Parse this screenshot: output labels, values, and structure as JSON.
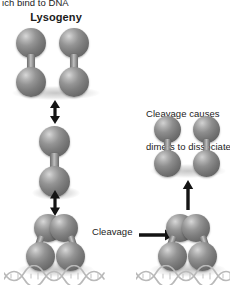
{
  "figure": {
    "title_fragment": "ich bind to DNA",
    "background_color": "#ffffff",
    "molecule_color": "#808080",
    "ink_color": "#1b1b1b"
  },
  "labels": {
    "caption_top": "ich bind to DNA",
    "lysogeny": "Lysogeny",
    "cleavage_causes_line1": "Cleavage causes",
    "cleavage_causes_line2": "dimers to dissociate",
    "cleavage": "Cleavage"
  },
  "panels": {
    "left": {
      "name": "lysogeny-pathway",
      "heading": "Lysogeny",
      "states": [
        {
          "id": "tetramer-pair",
          "description": "two free dimers side by side",
          "dimers": 2,
          "monomers_per_dimer": 2
        },
        {
          "id": "free-dimer",
          "description": "single free dimer",
          "dimers": 1,
          "monomers_per_dimer": 2
        },
        {
          "id": "dna-bound-dimer",
          "description": "dimer bound to DNA operator",
          "dimers": 1,
          "dna_bound": true
        }
      ],
      "equilibrium_arrows": 2
    },
    "right": {
      "name": "cleavage-pathway",
      "heading_line1": "Cleavage causes",
      "heading_line2": "dimers to dissociate",
      "states": [
        {
          "id": "dissociated-monomers",
          "description": "four dissociated monomers",
          "monomers": 4
        },
        {
          "id": "dna-bound-dimer-cleaved",
          "description": "DNA-bound dimer being cleaved",
          "dimers": 1,
          "dna_bound": true
        }
      ],
      "transition_arrow": "up"
    }
  },
  "annotations": {
    "cleavage_arrow": {
      "label": "Cleavage",
      "direction": "right",
      "points_to": "dna-bound-dimer-cleaved"
    }
  }
}
